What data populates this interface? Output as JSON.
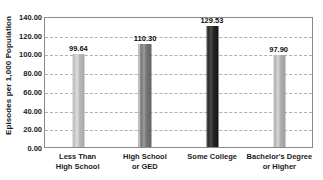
{
  "chart_data": {
    "type": "bar",
    "title": "",
    "xlabel": "",
    "ylabel": "Episodes per 1,000 Population",
    "ylim": [
      0,
      140
    ],
    "ytick_step": 20,
    "grid": true,
    "legend": "none",
    "categories": [
      "Less Than High School",
      "High School or GED",
      "Some College",
      "Bachelor's Degree or Higher"
    ],
    "values": [
      99.64,
      110.3,
      129.53,
      97.9
    ],
    "value_labels": [
      "99.64",
      "110.30",
      "129.53",
      "97.90"
    ],
    "ytick_labels": [
      "140.00",
      "120.00",
      "100.00",
      "80.00",
      "60.00",
      "40.00",
      "20.00",
      "0.00"
    ],
    "ytick_values": [
      140,
      120,
      100,
      80,
      60,
      40,
      20,
      0
    ],
    "bar_colors": [
      "#b9b9b9",
      "#757575",
      "#262626",
      "#b0b0b0"
    ]
  },
  "axis": {
    "y_title": "Episodes per 1,000 Population"
  },
  "categories_wrapped": [
    {
      "line1": "Less Than",
      "line2": "High School"
    },
    {
      "line1": "High School",
      "line2": "or GED"
    },
    {
      "line1": "Some College",
      "line2": ""
    },
    {
      "line1": "Bachelor's Degree",
      "line2": "or Higher"
    }
  ]
}
